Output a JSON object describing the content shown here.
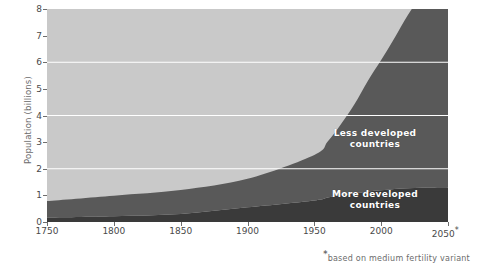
{
  "chart_data": {
    "type": "area",
    "title": "",
    "subtitle": "",
    "xlabel": "",
    "ylabel": "Population (billions)",
    "xlim": [
      1750,
      2050
    ],
    "ylim": [
      0,
      8
    ],
    "grid": "horizontal white gridlines at 2, 4 and 6 billion",
    "legend_position": "inside-plot-right",
    "stacked": true,
    "x": [
      1750,
      1800,
      1850,
      1900,
      1950,
      1960,
      1970,
      1980,
      1990,
      2000,
      2010,
      2020,
      2030,
      2040,
      2050
    ],
    "series": [
      {
        "name": "More developed countries",
        "color": "#3a3a3a",
        "values": [
          0.17,
          0.22,
          0.3,
          0.55,
          0.81,
          0.92,
          1.01,
          1.08,
          1.15,
          1.19,
          1.24,
          1.27,
          1.29,
          1.3,
          1.3
        ]
      },
      {
        "name": "Less developed countries",
        "color": "#595959",
        "values": [
          0.62,
          0.77,
          0.9,
          1.07,
          1.71,
          2.1,
          2.67,
          3.34,
          4.15,
          4.89,
          5.67,
          6.5,
          7.22,
          7.74,
          8.1
        ]
      }
    ],
    "total_values": [
      0.79,
      0.99,
      1.2,
      1.62,
      2.52,
      3.02,
      3.68,
      4.42,
      5.3,
      6.08,
      6.91,
      7.77,
      8.51,
      9.04,
      9.4
    ],
    "yticks": [
      {
        "value": 0,
        "label": "0"
      },
      {
        "value": 1,
        "label": "1"
      },
      {
        "value": 2,
        "label": "2"
      },
      {
        "value": 3,
        "label": "3"
      },
      {
        "value": 4,
        "label": "4"
      },
      {
        "value": 5,
        "label": "5"
      },
      {
        "value": 6,
        "label": "6"
      },
      {
        "value": 7,
        "label": "7"
      },
      {
        "value": 8,
        "label": "8"
      }
    ],
    "xticks": [
      {
        "value": 1750,
        "label": "1750"
      },
      {
        "value": 1800,
        "label": "1800"
      },
      {
        "value": 1850,
        "label": "1850"
      },
      {
        "value": 1900,
        "label": "1900"
      },
      {
        "value": 1950,
        "label": "1950"
      },
      {
        "value": 2000,
        "label": "2000"
      },
      {
        "value": 2050,
        "label": "2050"
      }
    ],
    "gridlines": [
      2,
      4,
      6
    ],
    "annotations": [
      {
        "id": "less",
        "text": "Less developed\ncountries"
      },
      {
        "id": "more",
        "text": "More developed\ncountries"
      }
    ],
    "footnote": "based on medium fertility variant",
    "footnote_marker": "*",
    "last_xtick_marker": "*",
    "colors": {
      "plot_background": "#c9c9c9",
      "less_developed": "#595959",
      "more_developed": "#3a3a3a",
      "gridline": "#ffffff",
      "axis": "#6d6d6d",
      "tick_text": "#4a4a4a",
      "label_text": "#6b6b6b",
      "series_label_text": "#ffffff"
    }
  }
}
